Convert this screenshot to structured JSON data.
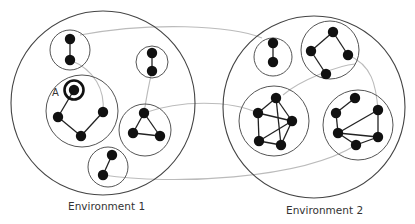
{
  "colors": {
    "background": "#ffffff",
    "environment_stroke": "#444444",
    "cluster_stroke": "#555555",
    "node_fill": "#111111",
    "edge_stroke": "#222222",
    "link_stroke": "#bbbbbb",
    "text": "#333333"
  },
  "environments": [
    {
      "id": "env1",
      "label": "Environment 1",
      "circle": {
        "cx": 103,
        "cy": 103,
        "r": 92
      },
      "clusters": [
        {
          "id": "e1c1",
          "circle": {
            "cx": 70,
            "cy": 50,
            "r": 20
          },
          "nodes": [
            [
              70,
              39
            ],
            [
              70,
              60
            ]
          ],
          "edges": [
            [
              0,
              1
            ]
          ]
        },
        {
          "id": "e1c2",
          "circle": {
            "cx": 82,
            "cy": 111,
            "r": 36
          },
          "nodes": [
            [
              74,
              90
            ],
            [
              58,
              117
            ],
            [
              103,
              112
            ],
            [
              81,
              136
            ]
          ],
          "edges": [
            [
              0,
              1
            ],
            [
              1,
              3
            ],
            [
              3,
              2
            ]
          ],
          "highlight_node": 0
        },
        {
          "id": "e1c3",
          "circle": {
            "cx": 152,
            "cy": 62,
            "r": 16
          },
          "nodes": [
            [
              152,
              53
            ],
            [
              152,
              71
            ]
          ],
          "edges": [
            [
              0,
              1
            ]
          ]
        },
        {
          "id": "e1c4",
          "circle": {
            "cx": 145,
            "cy": 130,
            "r": 26
          },
          "nodes": [
            [
              144,
              113
            ],
            [
              133,
              133
            ],
            [
              160,
              136
            ]
          ],
          "edges": [
            [
              0,
              1
            ],
            [
              1,
              2
            ],
            [
              2,
              0
            ]
          ]
        },
        {
          "id": "e1c5",
          "circle": {
            "cx": 108,
            "cy": 167,
            "r": 20
          },
          "nodes": [
            [
              112,
              155
            ],
            [
              103,
              175
            ]
          ],
          "edges": [
            [
              0,
              1
            ]
          ]
        }
      ]
    },
    {
      "id": "env2",
      "label": "Environment 2",
      "circle": {
        "cx": 314,
        "cy": 107,
        "r": 91
      },
      "clusters": [
        {
          "id": "e2c1",
          "circle": {
            "cx": 273,
            "cy": 57,
            "r": 19
          },
          "nodes": [
            [
              273,
              43
            ],
            [
              273,
              62
            ]
          ],
          "edges": [
            [
              0,
              1
            ]
          ]
        },
        {
          "id": "e2c2",
          "circle": {
            "cx": 330,
            "cy": 50,
            "r": 29
          },
          "nodes": [
            [
              333,
              32
            ],
            [
              311,
              51
            ],
            [
              348,
              55
            ],
            [
              326,
              74
            ]
          ],
          "edges": [
            [
              0,
              1
            ],
            [
              0,
              2
            ],
            [
              1,
              3
            ]
          ]
        },
        {
          "id": "e2c3",
          "circle": {
            "cx": 274,
            "cy": 121,
            "r": 35
          },
          "nodes": [
            [
              276,
              98
            ],
            [
              258,
              113
            ],
            [
              292,
              121
            ],
            [
              259,
              141
            ],
            [
              281,
              145
            ]
          ],
          "edges": [
            [
              0,
              1
            ],
            [
              0,
              4
            ],
            [
              1,
              2
            ],
            [
              1,
              3
            ],
            [
              3,
              4
            ],
            [
              4,
              2
            ],
            [
              2,
              3
            ],
            [
              0,
              2
            ]
          ]
        },
        {
          "id": "e2c4",
          "circle": {
            "cx": 358,
            "cy": 125,
            "r": 35
          },
          "nodes": [
            [
              355,
              98
            ],
            [
              336,
              113
            ],
            [
              378,
              110
            ],
            [
              338,
              133
            ],
            [
              378,
              137
            ],
            [
              356,
              145
            ]
          ],
          "edges": [
            [
              0,
              1
            ],
            [
              1,
              3
            ],
            [
              3,
              2
            ],
            [
              2,
              4
            ],
            [
              3,
              4
            ],
            [
              3,
              5
            ],
            [
              5,
              4
            ]
          ]
        }
      ]
    }
  ],
  "links": [
    {
      "d": "M 80 35 C 150 22, 230 25, 262 38"
    },
    {
      "d": "M 70 60 C 95 70, 105 90, 103 112"
    },
    {
      "d": "M 152 71 C 148 88, 146 100, 144 113"
    },
    {
      "d": "M 144 113 C 180 100, 230 100, 258 113"
    },
    {
      "d": "M 103 175 C 170 185, 300 180, 356 145"
    },
    {
      "d": "M 283 95 C 300 80, 340 65, 355 64"
    },
    {
      "d": "M 348 55 C 372 65, 376 85, 378 110"
    }
  ],
  "annotations": {
    "node_a_label": "A"
  }
}
